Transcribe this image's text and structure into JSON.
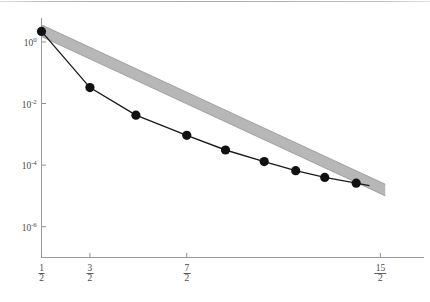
{
  "figure": {
    "kind": "log-linear convergence plot",
    "background": "#ffffff",
    "top_rule": true
  },
  "chart_data": {
    "type": "line",
    "title": "",
    "subtitle": "",
    "xlabel": "",
    "ylabel": "",
    "grid": false,
    "legend": null,
    "yscale": "log",
    "ylim": [
      1e-07,
      6.0
    ],
    "y_ticks": [
      {
        "value": 1.0,
        "label_mantissa": "10",
        "label_exponent": "0"
      },
      {
        "value": 0.01,
        "label_mantissa": "10",
        "label_exponent": "-2"
      },
      {
        "value": 0.0001,
        "label_mantissa": "10",
        "label_exponent": "-4"
      },
      {
        "value": 1e-06,
        "label_mantissa": "10",
        "label_exponent": "-6"
      }
    ],
    "xlim": [
      0.5,
      8.4
    ],
    "x_ticks": [
      {
        "value": 0.5,
        "num": "1",
        "den": "2"
      },
      {
        "value": 1.5,
        "num": "3",
        "den": "2"
      },
      {
        "value": 3.5,
        "num": "7",
        "den": "2"
      },
      {
        "value": 7.5,
        "num": "15",
        "den": "2"
      }
    ],
    "series": [
      {
        "name": "error",
        "color": "#1a1a1a",
        "marker": "filled-circle",
        "marker_color": "#111111",
        "x": [
          0.5,
          1.5,
          2.45,
          3.5,
          4.3,
          5.1,
          5.75,
          6.35,
          7.0
        ],
        "y": [
          2.2,
          0.033,
          0.0042,
          0.00093,
          0.00031,
          0.00013,
          6.6e-05,
          4e-05,
          2.6e-05
        ]
      },
      {
        "name": "fit-band",
        "color": "#9a9a9a",
        "kind": "band",
        "x": [
          0.5,
          7.6
        ],
        "y_upper": [
          3.6,
          2.4e-05
        ],
        "y_lower": [
          1.5,
          1e-05
        ]
      }
    ],
    "annotations": []
  },
  "colors": {
    "axis": "#8f8f8f",
    "tick_label": "#4a4a4a",
    "line": "#1a1a1a",
    "band": "#a0a0a0",
    "marker": "#111111",
    "top_rule": "#9a9a9a"
  }
}
